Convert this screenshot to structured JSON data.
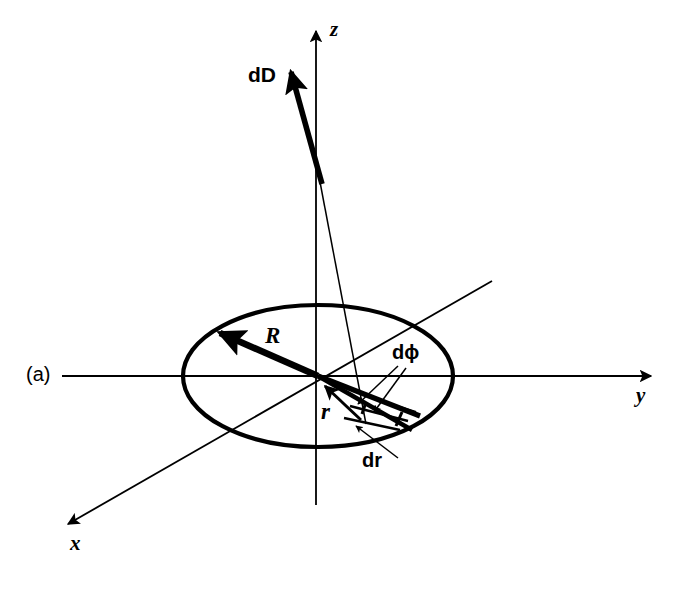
{
  "figure": {
    "panel_label": "(a)",
    "caption_text": "",
    "background_color": "#ffffff",
    "stroke_color": "#000000",
    "width": 687,
    "height": 591
  },
  "axes": [
    {
      "id": "z",
      "label": "z",
      "label_x": 330,
      "label_y": 21,
      "x1": 316,
      "y1": 505,
      "x2": 316,
      "y2": 26,
      "arrow": "end",
      "stroke_width": 1.8
    },
    {
      "id": "y",
      "label": "y",
      "label_x": 636,
      "label_y": 387,
      "x1": 62,
      "y1": 376,
      "x2": 657,
      "y2": 376,
      "arrow": "end",
      "stroke_width": 1.8
    },
    {
      "id": "x",
      "label": "x",
      "label_x": 70,
      "label_y": 535,
      "x1": 492,
      "y1": 281,
      "x2": 63,
      "y2": 527,
      "arrow": "end",
      "stroke_width": 1.8
    }
  ],
  "disk": {
    "name": "charged-disk",
    "center_x": 318,
    "center_y": 376,
    "radius_x": 135,
    "radius_y": 71,
    "stroke_width": 4.2
  },
  "vectors": [
    {
      "id": "R",
      "label": "R",
      "label_x": 265,
      "label_y": 326,
      "x1": 318,
      "y1": 376,
      "x2": 216,
      "y2": 331,
      "stroke_width": 6.5,
      "head": "large"
    },
    {
      "id": "dD",
      "label": "dD",
      "label_x": 249,
      "label_y": 65,
      "x1": 322,
      "y1": 184,
      "x2": 288,
      "y2": 62,
      "stroke_width": 5.5,
      "head": "large"
    },
    {
      "id": "r",
      "label": "r",
      "label_x": 322,
      "label_y": 402,
      "x1": 359,
      "y1": 418,
      "x2": 324,
      "y2": 385,
      "stroke_width": 3.0,
      "head": "small"
    }
  ],
  "field_line": {
    "name": "dD-source-ray",
    "x1": 366,
    "y1": 424,
    "x2": 320,
    "y2": 182,
    "stroke_width": 1.5
  },
  "element": {
    "name": "area-element-dA",
    "description": "wedge r dphi dr",
    "r_inner": 54,
    "r_outer": 98,
    "phi_start_deg": -14,
    "phi_span_deg": -12,
    "stroke_width": 4.5
  },
  "annotations": [
    {
      "id": "dphi",
      "label": "dϕ",
      "label_x": 393,
      "label_y": 344,
      "leader": [
        {
          "x1": 396,
          "y1": 365,
          "x2": 357,
          "y2": 403
        },
        {
          "x1": 402,
          "y1": 367,
          "x2": 372,
          "y2": 411
        }
      ]
    },
    {
      "id": "dr",
      "label": "dr",
      "label_x": 363,
      "label_y": 452,
      "leader": [
        {
          "x1": 396,
          "y1": 456,
          "x2": 355,
          "y2": 424
        }
      ]
    }
  ],
  "panel": {
    "label": "(a)",
    "label_x": 26,
    "label_y": 365
  }
}
